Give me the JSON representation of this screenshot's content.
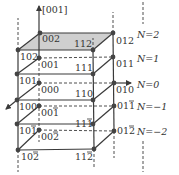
{
  "axis": {
    "z_label": "[001]"
  },
  "colors": {
    "line": "#3a3a3a",
    "node": "#444444",
    "shade": "#cfcfcf",
    "text": "#333333"
  },
  "nodes": [
    {
      "id": "002",
      "label": "002",
      "x": 40,
      "y": 33,
      "bar": false
    },
    {
      "id": "012",
      "label": "012",
      "x": 113,
      "y": 33,
      "bar": false
    },
    {
      "id": "102",
      "label": "102",
      "x": 18,
      "y": 50,
      "bar": false
    },
    {
      "id": "112",
      "label": "112",
      "x": 93,
      "y": 50,
      "bar": false
    },
    {
      "id": "001",
      "label": "001",
      "x": 39,
      "y": 58,
      "bar": false
    },
    {
      "id": "011",
      "label": "011",
      "x": 113,
      "y": 57,
      "bar": false
    },
    {
      "id": "101",
      "label": "101",
      "x": 17,
      "y": 74,
      "bar": false
    },
    {
      "id": "111",
      "label": "111",
      "x": 93,
      "y": 74,
      "bar": false
    },
    {
      "id": "000",
      "label": "000",
      "x": 39,
      "y": 83,
      "bar": false
    },
    {
      "id": "010",
      "label": "010",
      "x": 114,
      "y": 83,
      "bar": false
    },
    {
      "id": "100",
      "label": "100",
      "x": 17,
      "y": 100,
      "bar": false
    },
    {
      "id": "110",
      "label": "110",
      "x": 93,
      "y": 100,
      "bar": false
    },
    {
      "id": "00-1",
      "label": "001",
      "x": 39,
      "y": 106,
      "bar": true
    },
    {
      "id": "01-1",
      "label": "011",
      "x": 114,
      "y": 106,
      "bar": true
    },
    {
      "id": "10-1",
      "label": "101",
      "x": 17,
      "y": 124,
      "bar": true
    },
    {
      "id": "11-1",
      "label": "111",
      "x": 93,
      "y": 124,
      "bar": true
    },
    {
      "id": "00-2",
      "label": "002",
      "x": 39,
      "y": 130,
      "bar": true
    },
    {
      "id": "01-2",
      "label": "012",
      "x": 114,
      "y": 131,
      "bar": true
    },
    {
      "id": "10-2",
      "label": "102",
      "x": 18,
      "y": 150,
      "bar": true
    },
    {
      "id": "11-2",
      "label": "112",
      "x": 94,
      "y": 149,
      "bar": true
    }
  ],
  "levels": [
    {
      "label": "N=2",
      "y": 38
    },
    {
      "label": "N=1",
      "y": 62
    },
    {
      "label": "N=0",
      "y": 88
    },
    {
      "label": "N=−1",
      "y": 110
    },
    {
      "label": "N=−2",
      "y": 135
    }
  ]
}
